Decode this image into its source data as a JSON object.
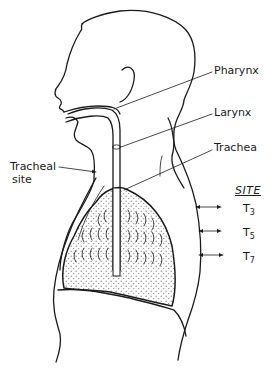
{
  "diagram": {
    "type": "anatomical-illustration",
    "labels": {
      "pharynx": "Pharynx",
      "larynx": "Larynx",
      "trachea": "Trachea",
      "tracheal_site_line1": "Tracheal",
      "tracheal_site_line2": "site"
    },
    "site_legend": {
      "heading": "SITE",
      "items": [
        {
          "letter": "T",
          "sub": "3"
        },
        {
          "letter": "T",
          "sub": "5"
        },
        {
          "letter": "T",
          "sub": "7"
        }
      ]
    },
    "colors": {
      "ink": "#1a1a1a",
      "background": "#ffffff",
      "lung_stipple": "#8a8a8a"
    }
  }
}
